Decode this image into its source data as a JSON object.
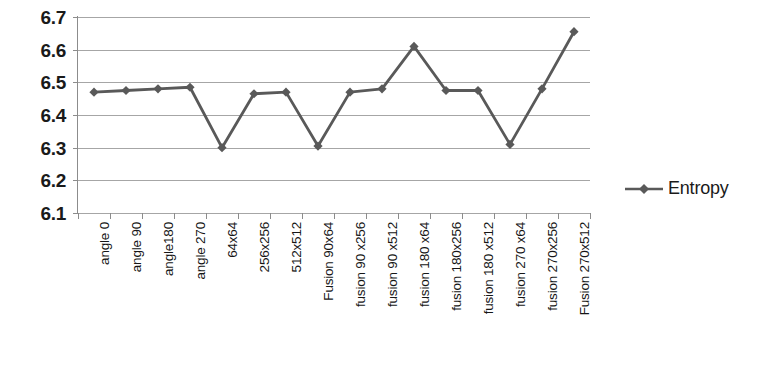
{
  "chart_data": {
    "type": "line",
    "title": "",
    "xlabel": "",
    "ylabel": "",
    "ylim": [
      6.1,
      6.7
    ],
    "ytick_step": 0.1,
    "grid": true,
    "legend_position": "right",
    "line_color": "#595959",
    "marker": "diamond",
    "marker_color": "#595959",
    "gridline_color": "#a6a6a6",
    "axis_color": "#8c8c8c",
    "ticks": [
      "6.1",
      "6.2",
      "6.3",
      "6.4",
      "6.5",
      "6.6",
      "6.7"
    ],
    "categories": [
      "angle 0",
      "angle 90",
      "angle180",
      "angle 270",
      "64x64",
      "256x256",
      "512x512",
      "Fusion 90x64",
      "fusion 90 x256",
      "fusion 90 x512",
      "fusion 180 x64",
      "fusion 180x256",
      "fusion 180 x512",
      "fusion 270 x64",
      "fusion 270x256",
      "Fusion 270x512"
    ],
    "series": [
      {
        "name": "Entropy",
        "values": [
          6.47,
          6.475,
          6.48,
          6.485,
          6.3,
          6.465,
          6.47,
          6.305,
          6.47,
          6.48,
          6.61,
          6.475,
          6.475,
          6.31,
          6.48,
          6.655
        ]
      }
    ]
  },
  "legend": {
    "entries": [
      {
        "label": "Entropy",
        "icon": "line-diamond-marker-icon"
      }
    ]
  }
}
